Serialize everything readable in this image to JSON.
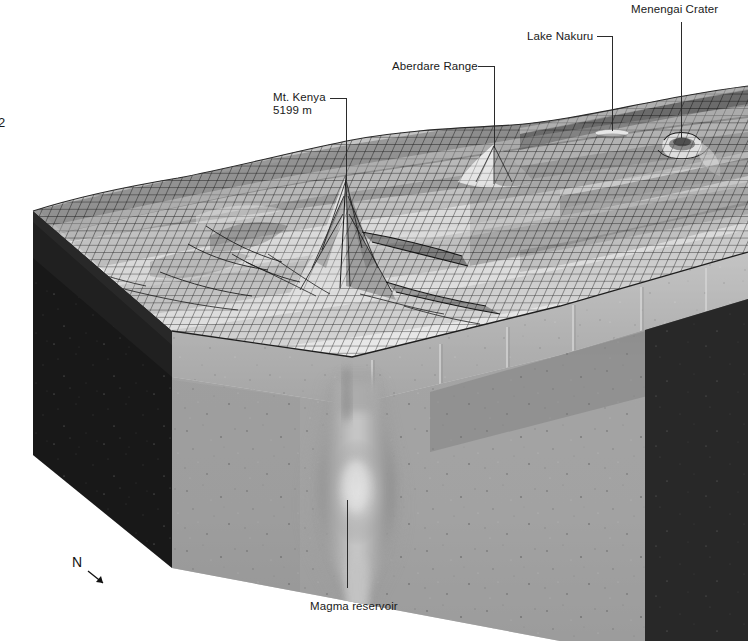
{
  "figure": {
    "page_number": "2",
    "type": "block-diagram",
    "background_color": "#ffffff"
  },
  "compass": {
    "letter": "N",
    "arrow_icon": "arrow-down-right-icon"
  },
  "annotations": [
    {
      "id": "mt-kenya",
      "line1": "Mt. Kenya",
      "line2": "5199 m",
      "text_x": 273,
      "text_y": 101,
      "leader": "M 330 98 L 346 98 L 346 180"
    },
    {
      "id": "aberdare-range",
      "line1": "Aberdare Range",
      "line2": "",
      "text_x": 392,
      "text_y": 70,
      "leader": "M 478 66 L 494 66 L 494 148"
    },
    {
      "id": "lake-nakuru",
      "line1": "Lake Nakuru",
      "line2": "",
      "text_x": 527,
      "text_y": 40,
      "leader": "M 597 36 L 612 36 L 612 131"
    },
    {
      "id": "menengai-crater",
      "line1": "Menengai Crater",
      "line2": "",
      "text_x": 631,
      "text_y": 13,
      "leader": "M 681 22 L 681 138"
    },
    {
      "id": "magma-reservoir",
      "line1": "Magma reservoir",
      "line2": "",
      "text_x": 310,
      "text_y": 610,
      "leader": "M 347 588 L 347 500"
    }
  ],
  "colors": {
    "mesh_line": "#2a2a2a",
    "mesh_fill_light": "#e9e9e9",
    "mesh_fill_dark": "#b9b9b9",
    "crust_face": "#a9a9a9",
    "crust_top": "#c6c6c6",
    "left_face_dark": "#1c1c1c",
    "mantle_face": "#9a9a9a",
    "right_face_dark": "#2e2e2e",
    "plume": "#b2b2b2",
    "label_text": "#1a1a1a",
    "leader_line": "#2b2b2b"
  },
  "geometry": {
    "top_left_corner": [
      33,
      211
    ],
    "top_front_corner": [
      172,
      330
    ],
    "top_right_corner": [
      748,
      250
    ],
    "bottom_front_corner": [
      172,
      568
    ],
    "bottom_left_corner": [
      33,
      455
    ],
    "crust_thickness_px": 48
  }
}
